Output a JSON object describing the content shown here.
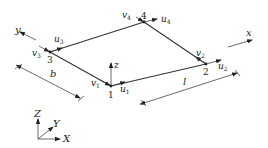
{
  "diagram": {
    "nodes": [
      {
        "id": "1",
        "u": "u",
        "u_sub": "1",
        "v": "v",
        "v_sub": "1"
      },
      {
        "id": "2",
        "u": "u",
        "u_sub": "2",
        "v": "v",
        "v_sub": "2"
      },
      {
        "id": "3",
        "u": "u",
        "u_sub": "3",
        "v": "v",
        "v_sub": "3"
      },
      {
        "id": "4",
        "u": "u",
        "u_sub": "4",
        "v": "v",
        "v_sub": "4"
      }
    ],
    "local_axes": {
      "x": "x",
      "y": "y",
      "z": "z"
    },
    "global_axes": {
      "X": "X",
      "Y": "Y",
      "Z": "Z"
    },
    "dimensions": {
      "length": "l",
      "width": "b"
    }
  }
}
